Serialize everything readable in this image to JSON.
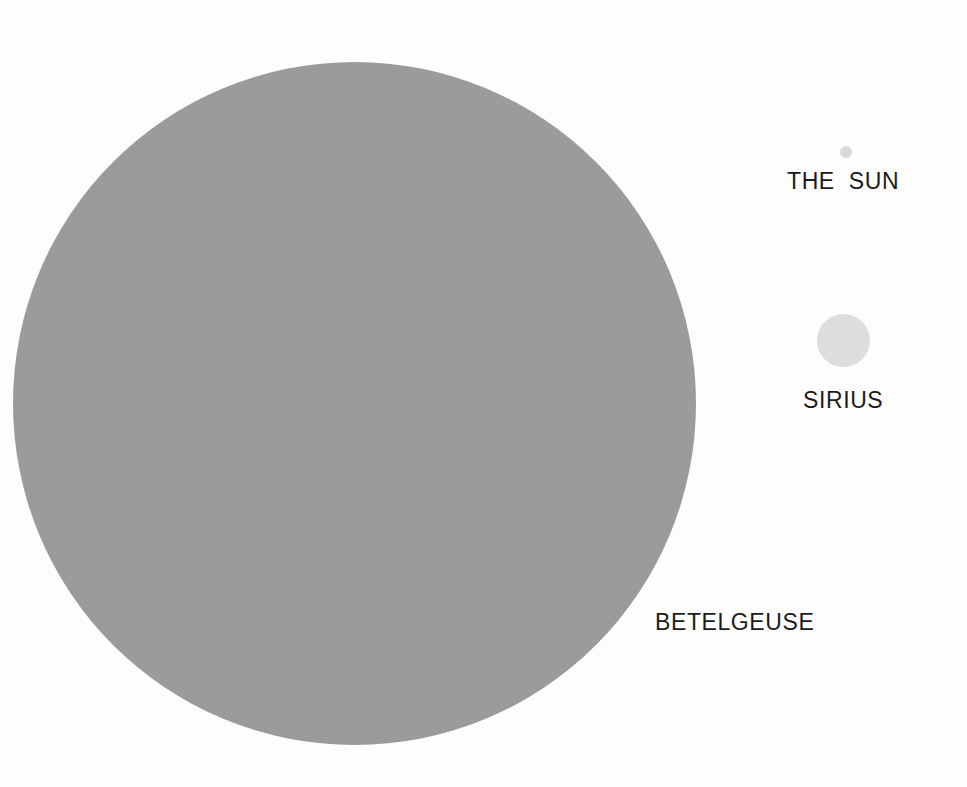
{
  "figure": {
    "background_color": "#fdfdfd",
    "text_color": "#1b1b1b"
  },
  "chart_data": {
    "type": "scatter",
    "title": "",
    "subtitle": "",
    "xlabel": "",
    "ylabel": "",
    "grid": false,
    "legend_position": "none",
    "categories": [
      "THE SUN",
      "SIRIUS",
      "BETELGEUSE"
    ],
    "values": [
      12,
      53,
      683
    ],
    "series": [
      {
        "name": "diameter_px",
        "values": [
          12,
          53,
          683
        ]
      },
      {
        "name": "relative_diameter",
        "values": [
          1.0,
          4.4,
          56.9
        ]
      }
    ],
    "points": [
      {
        "label": "THE SUN",
        "color": "#d9d9d9",
        "center_x": 846,
        "center_y": 152,
        "diameter_px": 12,
        "radius_px": 6,
        "relative_diameter": 1.0
      },
      {
        "label": "SIRIUS",
        "color": "#dddddd",
        "center_x": 843,
        "center_y": 340,
        "diameter_px": 53,
        "radius_px": 26.5,
        "relative_diameter": 4.4
      },
      {
        "label": "BETELGEUSE",
        "color": "#9b9b9b",
        "center_x": 354,
        "center_y": 403,
        "diameter_px": 683,
        "radius_px": 341.5,
        "relative_diameter": 56.9
      }
    ]
  },
  "stars": {
    "sun": {
      "label": "THE  SUN",
      "color": "#d9d9d9"
    },
    "sirius": {
      "label": "SIRIUS",
      "color": "#dddddd"
    },
    "betelgeuse": {
      "label": "BETELGEUSE",
      "color": "#9b9b9b"
    }
  }
}
